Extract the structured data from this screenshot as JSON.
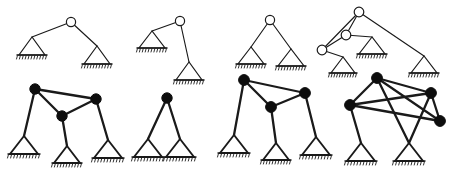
{
  "figure": {
    "background_color": "#ffffff",
    "line_color": "#1a1a1a",
    "joint_fill_hollow": "#ffffff",
    "joint_fill_solid": "#0d0d0d",
    "width": 459,
    "height": 179,
    "rows": [
      {
        "name": "top-row",
        "joint_style": "hollow",
        "line_weight": "thin"
      },
      {
        "name": "bottom-row",
        "joint_style": "filled",
        "line_weight": "thick"
      }
    ]
  },
  "diagrams": [
    {
      "id": "diagram-1",
      "label": "two-bar linkage with spread supports",
      "row": "top-row",
      "joint_style": "hollow",
      "line_weight": "thin",
      "joints": [
        {
          "name": "apex",
          "x": 71,
          "y": 22,
          "r": 4.6
        }
      ],
      "supports": [
        {
          "name": "support-left",
          "apex_x": 32,
          "apex_y": 37,
          "half_width": 13,
          "height": 18
        },
        {
          "name": "support-right",
          "apex_x": 97,
          "apex_y": 46,
          "half_width": 13,
          "height": 18
        }
      ],
      "members": [
        {
          "from": [
            71,
            22
          ],
          "to": [
            32,
            37
          ]
        },
        {
          "from": [
            71,
            22
          ],
          "to": [
            97,
            46
          ]
        }
      ]
    },
    {
      "id": "diagram-2",
      "label": "bent two-bar linkage with offset low support",
      "row": "top-row",
      "joint_style": "hollow",
      "line_weight": "thin",
      "joints": [
        {
          "name": "apex",
          "x": 180,
          "y": 21,
          "r": 4.6
        }
      ],
      "supports": [
        {
          "name": "support-left",
          "apex_x": 152,
          "apex_y": 31,
          "half_width": 13,
          "height": 17
        },
        {
          "name": "support-bottom",
          "apex_x": 189,
          "apex_y": 62,
          "half_width": 13,
          "height": 18
        }
      ],
      "members": [
        {
          "from": [
            180,
            21
          ],
          "to": [
            152,
            31
          ]
        },
        {
          "from": [
            180,
            21
          ],
          "to": [
            189,
            62
          ]
        }
      ]
    },
    {
      "id": "diagram-3",
      "label": "symmetric two-bar linkage",
      "row": "top-row",
      "joint_style": "hollow",
      "line_weight": "thin",
      "joints": [
        {
          "name": "apex",
          "x": 270,
          "y": 20,
          "r": 4.6
        }
      ],
      "supports": [
        {
          "name": "support-left",
          "apex_x": 251,
          "apex_y": 47,
          "half_width": 13,
          "height": 17
        },
        {
          "name": "support-right",
          "apex_x": 291,
          "apex_y": 49,
          "half_width": 13,
          "height": 17
        }
      ],
      "members": [
        {
          "from": [
            270,
            20
          ],
          "to": [
            251,
            47
          ]
        },
        {
          "from": [
            270,
            20
          ],
          "to": [
            291,
            49
          ]
        }
      ]
    },
    {
      "id": "diagram-4",
      "label": "three-joint chain linkage with three supports",
      "row": "top-row",
      "joint_style": "hollow",
      "line_weight": "thin",
      "joints": [
        {
          "name": "joint-top",
          "x": 359,
          "y": 12,
          "r": 4.8
        },
        {
          "name": "joint-middle",
          "x": 346,
          "y": 35,
          "r": 4.8
        },
        {
          "name": "joint-left",
          "x": 322,
          "y": 50,
          "r": 4.8
        }
      ],
      "supports": [
        {
          "name": "support-center",
          "apex_x": 372,
          "apex_y": 37,
          "half_width": 13,
          "height": 17
        },
        {
          "name": "support-lower-left",
          "apex_x": 343,
          "apex_y": 57,
          "half_width": 12,
          "height": 16
        },
        {
          "name": "support-right",
          "apex_x": 424,
          "apex_y": 56,
          "half_width": 13,
          "height": 17
        }
      ],
      "members": [
        {
          "from": [
            359,
            12
          ],
          "to": [
            346,
            35
          ]
        },
        {
          "from": [
            359,
            12
          ],
          "to": [
            322,
            50
          ]
        },
        {
          "from": [
            359,
            12
          ],
          "to": [
            424,
            56
          ]
        },
        {
          "from": [
            346,
            35
          ],
          "to": [
            322,
            50
          ]
        },
        {
          "from": [
            346,
            35
          ],
          "to": [
            372,
            37
          ]
        },
        {
          "from": [
            322,
            50
          ],
          "to": [
            343,
            57
          ]
        }
      ]
    },
    {
      "id": "diagram-5",
      "label": "three-node triangulated truss with three supports",
      "row": "bottom-row",
      "joint_style": "filled",
      "line_weight": "thick",
      "joints": [
        {
          "name": "node-left",
          "x": 35,
          "y": 89,
          "r": 5.2
        },
        {
          "name": "node-right",
          "x": 96,
          "y": 99,
          "r": 5.2
        },
        {
          "name": "node-middle",
          "x": 62,
          "y": 116,
          "r": 5.2
        }
      ],
      "supports": [
        {
          "name": "support-left",
          "apex_x": 24,
          "apex_y": 136,
          "half_width": 14,
          "height": 18
        },
        {
          "name": "support-center",
          "apex_x": 67,
          "apex_y": 146,
          "half_width": 13,
          "height": 17
        },
        {
          "name": "support-right",
          "apex_x": 108,
          "apex_y": 140,
          "half_width": 14,
          "height": 18
        }
      ],
      "members": [
        {
          "from": [
            35,
            89
          ],
          "to": [
            96,
            99
          ]
        },
        {
          "from": [
            35,
            89
          ],
          "to": [
            62,
            116
          ]
        },
        {
          "from": [
            96,
            99
          ],
          "to": [
            62,
            116
          ]
        },
        {
          "from": [
            35,
            89
          ],
          "to": [
            24,
            136
          ]
        },
        {
          "from": [
            62,
            116
          ],
          "to": [
            67,
            146
          ]
        },
        {
          "from": [
            96,
            99
          ],
          "to": [
            108,
            140
          ]
        }
      ]
    },
    {
      "id": "diagram-6",
      "label": "single-node two-leg truss",
      "row": "bottom-row",
      "joint_style": "filled",
      "line_weight": "thick",
      "joints": [
        {
          "name": "node-apex",
          "x": 167,
          "y": 98,
          "r": 5.2
        }
      ],
      "supports": [
        {
          "name": "support-left",
          "apex_x": 148,
          "apex_y": 139,
          "half_width": 14,
          "height": 18
        },
        {
          "name": "support-right",
          "apex_x": 180,
          "apex_y": 139,
          "half_width": 14,
          "height": 18
        }
      ],
      "members": [
        {
          "from": [
            167,
            98
          ],
          "to": [
            148,
            139
          ]
        },
        {
          "from": [
            167,
            98
          ],
          "to": [
            180,
            139
          ]
        }
      ]
    },
    {
      "id": "diagram-7",
      "label": "three-node triangulated truss with three supports",
      "row": "bottom-row",
      "joint_style": "filled",
      "line_weight": "thick",
      "joints": [
        {
          "name": "node-left",
          "x": 244,
          "y": 80,
          "r": 5.4
        },
        {
          "name": "node-right",
          "x": 305,
          "y": 93,
          "r": 5.4
        },
        {
          "name": "node-middle",
          "x": 271,
          "y": 107,
          "r": 5.4
        }
      ],
      "supports": [
        {
          "name": "support-left",
          "apex_x": 234,
          "apex_y": 135,
          "half_width": 14,
          "height": 18
        },
        {
          "name": "support-center",
          "apex_x": 276,
          "apex_y": 143,
          "half_width": 13,
          "height": 17
        },
        {
          "name": "support-right",
          "apex_x": 316,
          "apex_y": 137,
          "half_width": 14,
          "height": 18
        }
      ],
      "members": [
        {
          "from": [
            244,
            80
          ],
          "to": [
            305,
            93
          ]
        },
        {
          "from": [
            244,
            80
          ],
          "to": [
            271,
            107
          ]
        },
        {
          "from": [
            305,
            93
          ],
          "to": [
            271,
            107
          ]
        },
        {
          "from": [
            244,
            80
          ],
          "to": [
            234,
            135
          ]
        },
        {
          "from": [
            271,
            107
          ],
          "to": [
            276,
            143
          ]
        },
        {
          "from": [
            305,
            93
          ],
          "to": [
            316,
            137
          ]
        }
      ]
    },
    {
      "id": "diagram-8",
      "label": "four-node truss with crossing diagonal members",
      "row": "bottom-row",
      "joint_style": "filled",
      "line_weight": "thick",
      "joints": [
        {
          "name": "node-top",
          "x": 377,
          "y": 78,
          "r": 5.4
        },
        {
          "name": "node-upper-right",
          "x": 431,
          "y": 93,
          "r": 5.4
        },
        {
          "name": "node-left",
          "x": 350,
          "y": 105,
          "r": 5.4
        },
        {
          "name": "node-lower-right",
          "x": 440,
          "y": 121,
          "r": 5.4
        }
      ],
      "supports": [
        {
          "name": "support-left",
          "apex_x": 361,
          "apex_y": 143,
          "half_width": 14,
          "height": 18
        },
        {
          "name": "support-right",
          "apex_x": 409,
          "apex_y": 143,
          "half_width": 14,
          "height": 18
        }
      ],
      "members": [
        {
          "from": [
            377,
            78
          ],
          "to": [
            431,
            93
          ]
        },
        {
          "from": [
            377,
            78
          ],
          "to": [
            350,
            105
          ]
        },
        {
          "from": [
            377,
            78
          ],
          "to": [
            440,
            121
          ]
        },
        {
          "from": [
            350,
            105
          ],
          "to": [
            431,
            93
          ]
        },
        {
          "from": [
            350,
            105
          ],
          "to": [
            440,
            121
          ]
        },
        {
          "from": [
            431,
            93
          ],
          "to": [
            440,
            121
          ]
        },
        {
          "from": [
            350,
            105
          ],
          "to": [
            361,
            143
          ]
        },
        {
          "from": [
            377,
            78
          ],
          "to": [
            409,
            143
          ]
        },
        {
          "from": [
            431,
            93
          ],
          "to": [
            409,
            143
          ]
        }
      ]
    }
  ]
}
